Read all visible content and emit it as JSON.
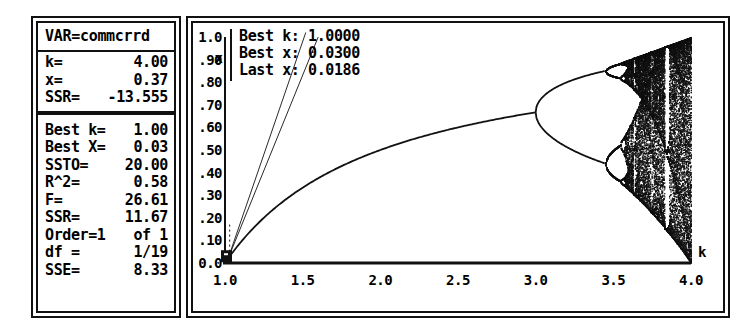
{
  "stats_panel": {
    "title": "VAR=commcrrd",
    "block1": [
      {
        "label": "k=",
        "value": "4.00"
      },
      {
        "label": "x=",
        "value": "0.37"
      },
      {
        "label": "SSR=",
        "value": "-13.555"
      }
    ],
    "block2": [
      {
        "label": "Best k=",
        "value": "1.00"
      },
      {
        "label": "Best X=",
        "value": "0.03"
      },
      {
        "label": "SSTO=",
        "value": "20.00"
      },
      {
        "label": "R^2=",
        "value": "0.58"
      },
      {
        "label": "F=",
        "value": "26.61"
      },
      {
        "label": "SSR=",
        "value": "11.67"
      },
      {
        "label": "Order=1",
        "value": "of 1"
      },
      {
        "label": "df =",
        "value": "1/19"
      },
      {
        "label": "SSE=",
        "value": "8.33"
      }
    ]
  },
  "plot_panel": {
    "annotation": [
      "Best k: 1.0000",
      "Best x: 0.0300",
      "Last x: 0.0186"
    ]
  },
  "chart_data": {
    "type": "scatter",
    "title": "",
    "xlabel": "k",
    "ylabel": "x",
    "xlim": [
      1.0,
      4.0
    ],
    "ylim": [
      0.0,
      1.0
    ],
    "grid": false,
    "legend": null,
    "xticks": [
      "1.0",
      "1.5",
      "2.0",
      "2.5",
      "3.0",
      "3.5",
      "4.0"
    ],
    "xtick_values": [
      1.0,
      1.5,
      2.0,
      2.5,
      3.0,
      3.5,
      4.0
    ],
    "yticks": [
      "0.0",
      ".10",
      ".20",
      ".30",
      ".40",
      ".50",
      ".60",
      ".70",
      ".80",
      ".90",
      "1.0"
    ],
    "ytick_values": [
      0.0,
      0.1,
      0.2,
      0.3,
      0.4,
      0.5,
      0.6,
      0.7,
      0.8,
      0.9,
      1.0
    ],
    "markers": [
      {
        "name": "best-point",
        "k": 1.0,
        "x": 0.03
      }
    ],
    "guide_lines": [
      {
        "name": "upper-guide",
        "from": [
          1.02,
          0.02
        ],
        "to": [
          1.52,
          1.02
        ]
      },
      {
        "name": "lower-guide",
        "from": [
          1.02,
          0.02
        ],
        "to": [
          1.6,
          1.0
        ]
      }
    ],
    "series": [
      {
        "name": "fixed-point-branch",
        "k_range": [
          1.0,
          3.0
        ],
        "formula": "x = 1 - 1/k",
        "points_k": [
          1.0,
          1.1,
          1.2,
          1.3,
          1.4,
          1.5,
          1.6,
          1.7,
          1.8,
          1.9,
          2.0,
          2.1,
          2.2,
          2.3,
          2.4,
          2.5,
          2.6,
          2.7,
          2.8,
          2.9,
          3.0
        ],
        "points_x": [
          0.0,
          0.091,
          0.167,
          0.231,
          0.286,
          0.333,
          0.375,
          0.412,
          0.444,
          0.474,
          0.5,
          0.524,
          0.545,
          0.565,
          0.583,
          0.6,
          0.615,
          0.63,
          0.643,
          0.655,
          0.667
        ]
      },
      {
        "name": "period-2-upper",
        "k_range": [
          3.0,
          3.449
        ],
        "points_k": [
          3.0,
          3.1,
          3.2,
          3.3,
          3.4,
          3.449
        ],
        "points_x": [
          0.667,
          0.765,
          0.8,
          0.824,
          0.842,
          0.849
        ]
      },
      {
        "name": "period-2-lower",
        "k_range": [
          3.0,
          3.449
        ],
        "points_k": [
          3.0,
          3.1,
          3.2,
          3.3,
          3.4,
          3.449
        ],
        "points_x": [
          0.667,
          0.558,
          0.513,
          0.479,
          0.452,
          0.44
        ]
      },
      {
        "name": "period-4-branches",
        "k_range": [
          3.449,
          3.544
        ],
        "branch_count": 4
      },
      {
        "name": "chaotic-region",
        "k_range": [
          3.57,
          4.0
        ],
        "note": "dense scatter filling most of x in [0,1]"
      }
    ],
    "bifurcations": [
      {
        "name": "period-2-onset",
        "k": 3.0
      },
      {
        "name": "period-4-onset",
        "k": 3.449
      },
      {
        "name": "period-8-onset",
        "k": 3.544
      },
      {
        "name": "chaos-onset",
        "k": 3.57
      }
    ],
    "windows": [
      {
        "name": "period-3-window",
        "k_range": [
          3.828,
          3.857
        ]
      }
    ]
  }
}
